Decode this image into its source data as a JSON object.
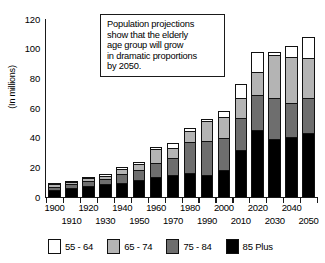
{
  "chart_data": {
    "type": "bar",
    "subtype": "stacked-vertical",
    "title": "",
    "xlabel": "",
    "ylabel": "(In millions)",
    "ylim": [
      0,
      120
    ],
    "ytick_labels": [
      "120",
      "100",
      "80",
      "60",
      "40",
      "20",
      "0"
    ],
    "ytick_values": [
      120,
      100,
      80,
      60,
      40,
      20,
      0
    ],
    "grid": false,
    "legend_position": "bottom",
    "categories": [
      "1900",
      "1910",
      "1920",
      "1930",
      "1940",
      "1950",
      "1960",
      "1970",
      "1980",
      "1990",
      "2000",
      "2010",
      "2020",
      "2030",
      "2040",
      "2050"
    ],
    "xtick_labels_row1": [
      "1900",
      "",
      "1920",
      "",
      "1940",
      "",
      "1960",
      "",
      "1980",
      "",
      "2000",
      "",
      "2020",
      "",
      "2040",
      ""
    ],
    "xtick_labels_row2": [
      "",
      "1910",
      "",
      "1930",
      "",
      "1950",
      "",
      "1970",
      "",
      "1990",
      "",
      "2010",
      "",
      "2030",
      "",
      "2050"
    ],
    "series": [
      {
        "name": "85 Plus",
        "color": "#000000",
        "values": [
          5,
          6,
          7.5,
          8.5,
          9.5,
          11.5,
          13.5,
          15,
          16,
          15,
          18,
          32,
          45,
          39,
          40.5,
          43
        ]
      },
      {
        "name": "75 - 84",
        "color": "#6e6e6e",
        "values": [
          2,
          2.5,
          3,
          3.5,
          6,
          6.5,
          9.5,
          11,
          21,
          23,
          22,
          21,
          24,
          28,
          23,
          24
        ]
      },
      {
        "name": "65 - 74",
        "color": "#b4b4b4",
        "values": [
          1.5,
          1.5,
          2,
          2.5,
          3.5,
          4.5,
          9.5,
          7,
          7.5,
          13,
          14,
          14,
          15,
          29,
          31,
          27
        ]
      },
      {
        "name": "55 - 64",
        "color": "#ffffff",
        "values": [
          1,
          0.8,
          1,
          1,
          1,
          1,
          1.5,
          3.5,
          2,
          1.5,
          4,
          9,
          14,
          2,
          7,
          14
        ]
      }
    ],
    "totals": [
      9.5,
      10.8,
      13.5,
      15.5,
      20,
      23.5,
      34,
      36.5,
      46.5,
      52.5,
      58,
      76,
      98,
      98,
      101.5,
      108
    ]
  },
  "annotation": {
    "lines": [
      "Population projections",
      "show that the elderly",
      "age group will grow",
      "in dramatic proportions",
      "by 2050."
    ]
  },
  "legend": {
    "items": [
      {
        "label": "55 - 64",
        "color": "#ffffff"
      },
      {
        "label": "65 - 74",
        "color": "#b4b4b4"
      },
      {
        "label": "75 - 84",
        "color": "#6e6e6e"
      },
      {
        "label": "85 Plus",
        "color": "#000000"
      }
    ]
  }
}
